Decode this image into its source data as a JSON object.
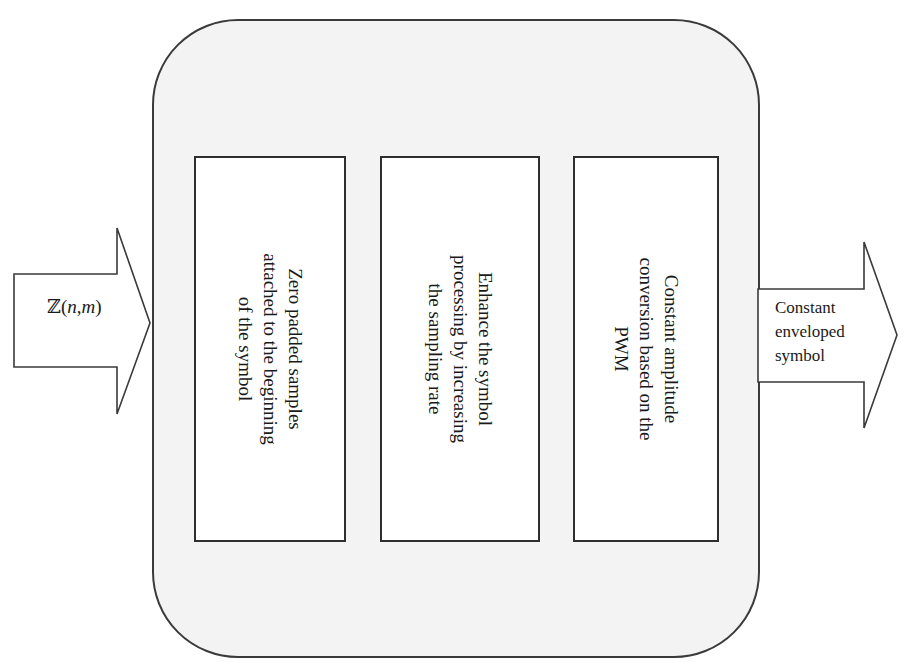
{
  "diagram": {
    "type": "block-flow",
    "input": {
      "symbol": "ℤ",
      "open_paren": "(",
      "var1": "n",
      "comma": ",",
      "var2": "m",
      "close_paren": ")"
    },
    "stages": [
      {
        "lines": [
          "Zero padded samples",
          "attached to the beginning",
          "of the symbol"
        ]
      },
      {
        "lines": [
          "Enhance the symbol",
          "processing by increasing",
          "the sampling rate"
        ]
      },
      {
        "lines": [
          "Constant amplitude",
          "conversion based on the",
          "PWM"
        ]
      }
    ],
    "output": {
      "lines": [
        "Constant",
        "enveloped",
        "symbol"
      ]
    },
    "colors": {
      "container_fill": "#f3f3f3",
      "stroke": "#2e2e2e",
      "box_fill": "#ffffff"
    }
  }
}
